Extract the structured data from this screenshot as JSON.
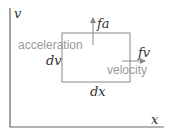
{
  "diagram": {
    "axes": {
      "y_label": "v",
      "x_label": "x",
      "color": "#666666"
    },
    "box": {
      "color": "#888888",
      "left_label": "dv",
      "bottom_label": "dx"
    },
    "arrows": {
      "vertical": {
        "label": "fa",
        "annotation": "acceleration"
      },
      "horizontal": {
        "label": "fv",
        "annotation": "velocity"
      }
    },
    "colors": {
      "math_text": "#333333",
      "annotation_text": "#999999"
    }
  }
}
